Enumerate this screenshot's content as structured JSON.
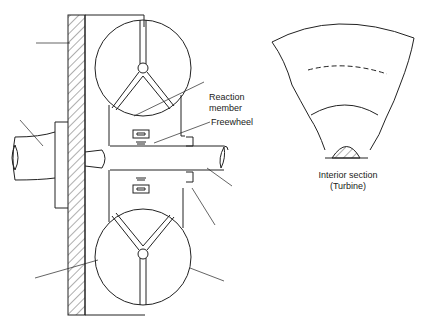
{
  "diagram": {
    "labels": {
      "reaction_member_line1": "Reaction",
      "reaction_member_line2": "member",
      "freewheel": "Freewheel",
      "interior_section_line1": "Interior section",
      "interior_section_line2": "(Turbine)"
    },
    "colors": {
      "line": "#222222",
      "background": "#ffffff"
    }
  }
}
